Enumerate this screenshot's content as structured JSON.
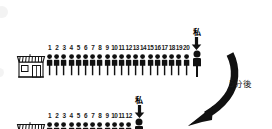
{
  "diagram": {
    "background_color": "#ffffff",
    "ink_color": "#111111",
    "transition": {
      "label": "5分後",
      "arrow_icon": "curved-down-left-arrow"
    },
    "rows": [
      {
        "id": "row-before",
        "shop_icon": "shop-storefront-icon",
        "count": 20,
        "numbers": [
          "1",
          "2",
          "3",
          "4",
          "5",
          "6",
          "7",
          "8",
          "9",
          "10",
          "11",
          "12",
          "13",
          "14",
          "15",
          "16",
          "17",
          "18",
          "19",
          "20"
        ],
        "person_icon": "person-standing-icon",
        "me": {
          "label": "私",
          "pointer_icon": "down-arrow-icon",
          "person_icon": "person-standing-highlight-icon"
        }
      },
      {
        "id": "row-after",
        "shop_icon": "shop-storefront-icon",
        "count": 12,
        "numbers": [
          "1",
          "2",
          "3",
          "4",
          "5",
          "6",
          "7",
          "8",
          "9",
          "10",
          "11",
          "12"
        ],
        "person_icon": "person-standing-icon",
        "me": {
          "label": "私",
          "pointer_icon": "down-arrow-icon",
          "person_icon": "person-standing-highlight-icon"
        }
      }
    ]
  }
}
